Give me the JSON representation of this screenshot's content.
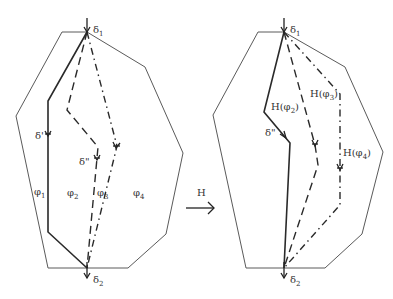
{
  "figure": {
    "left": {
      "labels": {
        "delta1": "δ",
        "delta1_sub": "1",
        "delta2": "δ",
        "delta2_sub": "2",
        "delta_prime": "δ'",
        "delta_dprime": "δ\"",
        "phi1": "φ",
        "phi1_sub": "1",
        "phi2": "φ",
        "phi2_sub": "2",
        "phi3": "φ",
        "phi3_sub": "3",
        "phi4": "φ",
        "phi4_sub": "4"
      }
    },
    "mapping": {
      "label": "H",
      "arrow": "right-arrow"
    },
    "right": {
      "labels": {
        "delta1": "δ",
        "delta1_sub": "1",
        "delta2": "δ",
        "delta2_sub": "2",
        "delta_dprime": "δ\"",
        "h_phi2": "H(φ",
        "h_phi2_sub": "2",
        "h_phi3": "H(φ",
        "h_phi3_sub": "3",
        "h_phi4": "H(φ",
        "h_phi4_sub": "4",
        "close_paren": ")"
      }
    }
  }
}
